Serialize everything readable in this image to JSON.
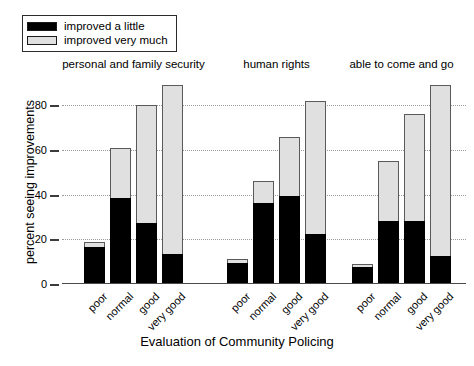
{
  "chart_data": {
    "type": "bar",
    "subtype": "stacked-grouped",
    "title": "",
    "xlabel": "Evaluation of Community Policing",
    "ylabel": "percent seeing improvements",
    "ylim": [
      0,
      95
    ],
    "yticks": [
      0,
      20,
      40,
      60,
      80
    ],
    "grid": "horizontal-dotted",
    "legend_position": "top-left",
    "categories": [
      "poor",
      "normal",
      "good",
      "very good"
    ],
    "series": [
      {
        "name": "improved a little",
        "color": "#000000"
      },
      {
        "name": "improved very much",
        "color": "#e0e0e0"
      }
    ],
    "groups": [
      {
        "name": "personal and family security",
        "bars": [
          {
            "category": "poor",
            "improved_a_little": 16,
            "improved_very_much": 3,
            "total": 19
          },
          {
            "category": "normal",
            "improved_a_little": 38,
            "improved_very_much": 23,
            "total": 61
          },
          {
            "category": "good",
            "improved_a_little": 27,
            "improved_very_much": 53,
            "total": 80
          },
          {
            "category": "very good",
            "improved_a_little": 13,
            "improved_very_much": 76,
            "total": 89
          }
        ]
      },
      {
        "name": "human rights",
        "bars": [
          {
            "category": "poor",
            "improved_a_little": 9,
            "improved_very_much": 2,
            "total": 11
          },
          {
            "category": "normal",
            "improved_a_little": 36,
            "improved_very_much": 10,
            "total": 46
          },
          {
            "category": "good",
            "improved_a_little": 39,
            "improved_very_much": 27,
            "total": 66
          },
          {
            "category": "very good",
            "improved_a_little": 22,
            "improved_very_much": 60,
            "total": 82
          }
        ]
      },
      {
        "name": "able to come and go",
        "bars": [
          {
            "category": "poor",
            "improved_a_little": 7,
            "improved_very_much": 2,
            "total": 9
          },
          {
            "category": "normal",
            "improved_a_little": 28,
            "improved_very_much": 27,
            "total": 55
          },
          {
            "category": "good",
            "improved_a_little": 28,
            "improved_very_much": 48,
            "total": 76
          },
          {
            "category": "very good",
            "improved_a_little": 12,
            "improved_very_much": 77,
            "total": 89
          }
        ]
      }
    ]
  },
  "legend": {
    "items": [
      {
        "label": "improved a little",
        "swatch": "black"
      },
      {
        "label": "improved very much",
        "swatch": "gray"
      }
    ]
  },
  "axis": {
    "x_title": "Evaluation of Community Policing",
    "y_title": "percent seeing improvements",
    "y_tick_labels": [
      "0",
      "20",
      "40",
      "60",
      "80"
    ]
  }
}
